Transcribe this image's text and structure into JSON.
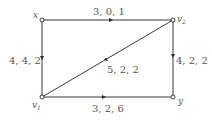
{
  "diagram": {
    "type": "flow-network",
    "nodes": [
      {
        "id": "x",
        "label": "x",
        "sub": "",
        "x": 42,
        "y": 20
      },
      {
        "id": "v2",
        "label": "v",
        "sub": "2",
        "x": 173,
        "y": 20
      },
      {
        "id": "v1",
        "label": "v",
        "sub": "1",
        "x": 42,
        "y": 97
      },
      {
        "id": "y",
        "label": "y",
        "sub": "",
        "x": 173,
        "y": 97
      }
    ],
    "edges": [
      {
        "from": "x",
        "to": "v2",
        "label": "3, 0, 1"
      },
      {
        "from": "x",
        "to": "v1",
        "label": "4, 4, 2"
      },
      {
        "from": "v2",
        "to": "y",
        "label": "4, 2, 2"
      },
      {
        "from": "v2",
        "to": "v1",
        "label": "5, 2, 2"
      },
      {
        "from": "v1",
        "to": "y",
        "label": "3, 2, 6"
      }
    ]
  }
}
